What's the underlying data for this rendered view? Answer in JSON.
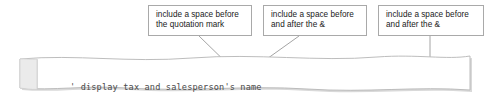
{
  "callouts": [
    {
      "id": "quotation-mark-note",
      "line1": "include a space before",
      "line2": "the quotation mark"
    },
    {
      "id": "ampersand-note-1",
      "line1": "include a space before",
      "line2": "and after the &"
    },
    {
      "id": "ampersand-note-2",
      "line1": "include a space before",
      "line2": "and after the &"
    }
  ],
  "code": {
    "comment": "' display tax and salesperson's name",
    "statement": "lblMessage.Text = \"The sales tax was \" & Convert.ToString(decSalesTax) & \".\""
  },
  "colors": {
    "callout_border": "#a9a9a9",
    "callout_background": "#ffffff",
    "leader_line": "#9a9a9a",
    "paper_border": "#b5b5b5",
    "paper_fill": "#ffffff",
    "gutter_fill": "#ebebeb",
    "shadow": "#d6d6d6",
    "code_text": "#1d1d1d",
    "comment_text": "#4a4a4a"
  }
}
